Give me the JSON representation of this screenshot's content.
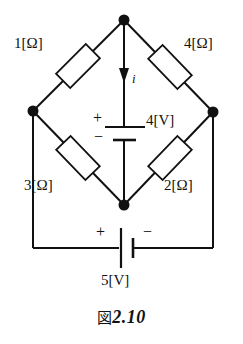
{
  "figure": {
    "caption_fig": "図",
    "caption_number": "2.10",
    "type": "electrical-circuit-diagram"
  },
  "components": {
    "resistors": [
      {
        "id": "r1",
        "label": "1[Ω]",
        "value": 1,
        "unit": "Ω",
        "position": "upper-left"
      },
      {
        "id": "r4",
        "label": "4[Ω]",
        "value": 4,
        "unit": "Ω",
        "position": "upper-right"
      },
      {
        "id": "r3",
        "label": "3[Ω]",
        "value": 3,
        "unit": "Ω",
        "position": "lower-left"
      },
      {
        "id": "r2",
        "label": "2[Ω]",
        "value": 2,
        "unit": "Ω",
        "position": "lower-right"
      }
    ],
    "sources": [
      {
        "id": "v4",
        "label": "4[V]",
        "value": 4,
        "unit": "V",
        "position": "center-vertical",
        "plus_sign": "+",
        "minus_sign": "−"
      },
      {
        "id": "v5",
        "label": "5[V]",
        "value": 5,
        "unit": "V",
        "position": "bottom-horizontal",
        "plus_sign": "+",
        "minus_sign": "−"
      }
    ],
    "current": {
      "id": "i",
      "label": "i",
      "direction": "downward",
      "position": "center-top-branch"
    }
  },
  "colors": {
    "line": "#111111",
    "background": "#ffffff",
    "node": "#111111"
  }
}
